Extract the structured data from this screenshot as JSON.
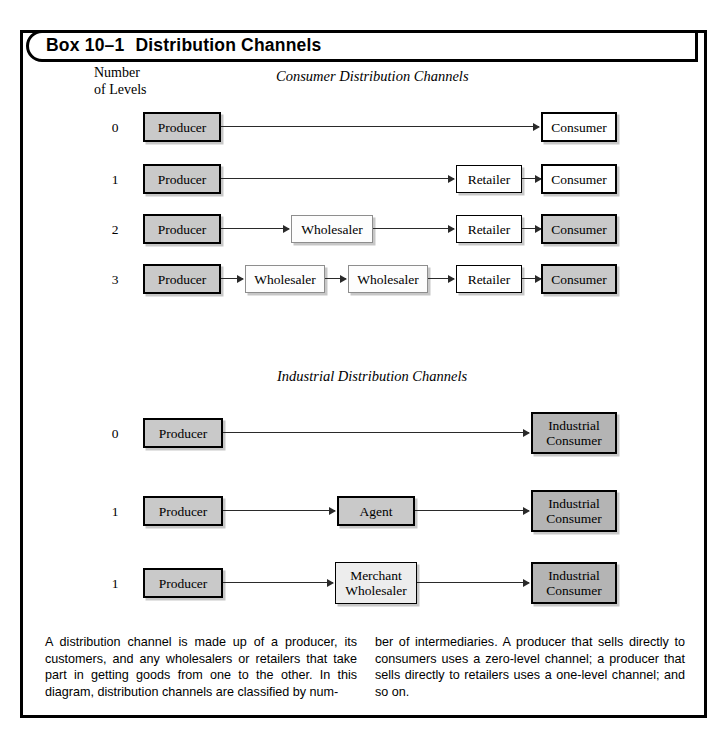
{
  "box": {
    "label": "Box 10–1",
    "title": "Distribution Channels"
  },
  "axis": {
    "line1": "Number",
    "line2": "of Levels"
  },
  "sections": [
    {
      "id": "consumer",
      "title": "Consumer Distribution Channels",
      "rows": [
        {
          "level": "0",
          "nodes": [
            "Producer",
            "Consumer"
          ]
        },
        {
          "level": "1",
          "nodes": [
            "Producer",
            "Retailer",
            "Consumer"
          ]
        },
        {
          "level": "2",
          "nodes": [
            "Producer",
            "Wholesaler",
            "Retailer",
            "Consumer"
          ]
        },
        {
          "level": "3",
          "nodes": [
            "Producer",
            "Wholesaler",
            "Wholesaler",
            "Retailer",
            "Consumer"
          ]
        }
      ]
    },
    {
      "id": "industrial",
      "title": "Industrial Distribution Channels",
      "rows": [
        {
          "level": "0",
          "nodes": [
            "Producer",
            "Industrial Consumer"
          ]
        },
        {
          "level": "1",
          "nodes": [
            "Producer",
            "Agent",
            "Industrial Consumer"
          ]
        },
        {
          "level": "1",
          "nodes": [
            "Producer",
            "Merchant Wholesaler",
            "Industrial Consumer"
          ]
        }
      ]
    }
  ],
  "nodes": {
    "producer": "Producer",
    "consumer": "Consumer",
    "retailer": "Retailer",
    "wholesaler": "Wholesaler",
    "agent": "Agent",
    "merchant_wholesaler_l1": "Merchant",
    "merchant_wholesaler_l2": "Wholesaler",
    "industrial_consumer_l1": "Industrial",
    "industrial_consumer_l2": "Consumer"
  },
  "levels": {
    "c0": "0",
    "c1": "1",
    "c2": "2",
    "c3": "3",
    "i0": "0",
    "i1": "1",
    "i2": "1"
  },
  "caption": {
    "left": "A distribution channel is made up of a producer, its customers, and any wholesalers or retailers that take part in getting goods from one to the other. In this diagram, distribution channels are classified by num-",
    "right": "ber of intermediaries. A producer that sells directly to consumers uses a zero-level channel; a producer that sells directly to retailers uses a one-level channel; and so on."
  },
  "colors": {
    "producer_fill": "#c9c9c9",
    "consumer_fill": "#ffffff",
    "retailer_fill": "#ffffff",
    "wholesaler_fill": "#fdfdfd",
    "agent_fill": "#c9c9c9",
    "merchant_fill": "#ededed",
    "industrial_consumer_fill": "#b4b4b4",
    "border": "#000000",
    "page_bg": "#ffffff"
  }
}
